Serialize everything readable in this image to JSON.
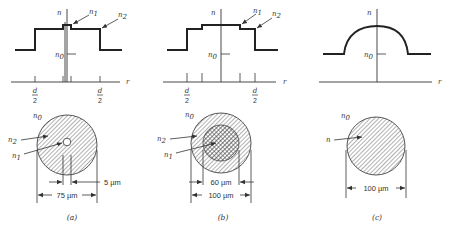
{
  "figure": {
    "panels": [
      {
        "id": "a",
        "caption": "(a)",
        "profile_type": "step-index with central dip",
        "axis_labels": {
          "vertical": "n",
          "horizontal": "r"
        },
        "level_labels": {
          "n0": "n",
          "n0_sub": "0",
          "n1": "n",
          "n1_sub": "1",
          "n2": "n",
          "n2_sub": "2"
        },
        "tick_labels": {
          "left": {
            "num": "d",
            "den": "2"
          },
          "right": {
            "num": "d",
            "den": "2"
          }
        },
        "cross_section_labels": {
          "outer": "n",
          "outer_sub": "0",
          "cladding": "n",
          "cladding_sub": "2",
          "core": "n",
          "core_sub": "1"
        },
        "dimensions": [
          {
            "label": "5 µm",
            "meaning": "inner core diameter"
          },
          {
            "label": "75 µm",
            "meaning": "cladding diameter"
          }
        ]
      },
      {
        "id": "b",
        "caption": "(b)",
        "profile_type": "double step-index",
        "axis_labels": {
          "vertical": "n",
          "horizontal": "r"
        },
        "level_labels": {
          "n0": "n",
          "n0_sub": "0",
          "n1": "n",
          "n1_sub": "1",
          "n2": "n",
          "n2_sub": "2"
        },
        "tick_labels": {
          "left": {
            "num": "d",
            "den": "2"
          },
          "right": {
            "num": "d",
            "den": "2"
          }
        },
        "cross_section_labels": {
          "outer": "n",
          "outer_sub": "0",
          "cladding": "n",
          "cladding_sub": "2",
          "core": "n",
          "core_sub": "1"
        },
        "dimensions": [
          {
            "label": "60 µm",
            "meaning": "core diameter"
          },
          {
            "label": "100 µm",
            "meaning": "cladding diameter"
          }
        ]
      },
      {
        "id": "c",
        "caption": "(c)",
        "profile_type": "graded-index",
        "axis_labels": {
          "vertical": "n",
          "horizontal": "r"
        },
        "level_labels": {
          "n0": "n",
          "n0_sub": "0"
        },
        "cross_section_labels": {
          "outer": "n",
          "outer_sub": "0",
          "core": "n"
        },
        "dimensions": [
          {
            "label": "100 µm",
            "meaning": "core diameter"
          }
        ]
      }
    ],
    "colors": {
      "ink": "#333333",
      "background": "#ffffff"
    }
  }
}
